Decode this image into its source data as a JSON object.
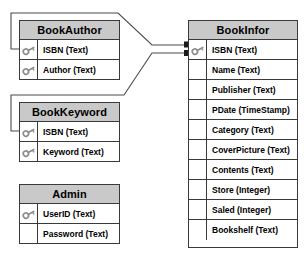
{
  "diagram": {
    "type": "er-diagram",
    "background_color": "#ffffff",
    "header_fill": "#c9c9c9",
    "border_color": "#3a3a3a",
    "key_icon_color": "#8c8c8c",
    "caption": ""
  },
  "entities": [
    {
      "id": "bookauthor",
      "name": "BookAuthor",
      "x": 19,
      "y": 20,
      "width": 101,
      "height": 60,
      "fields": [
        {
          "label": "ISBN (Text)",
          "key": true
        },
        {
          "label": "Author (Text)",
          "key": true
        }
      ]
    },
    {
      "id": "bookkeyword",
      "name": "BookKeyword",
      "x": 19,
      "y": 102,
      "width": 101,
      "height": 60,
      "fields": [
        {
          "label": "ISBN (Text)",
          "key": true
        },
        {
          "label": "Keyword (Text)",
          "key": true
        }
      ]
    },
    {
      "id": "admin",
      "name": "Admin",
      "x": 19,
      "y": 184,
      "width": 101,
      "height": 60,
      "fields": [
        {
          "label": "UserID (Text)",
          "key": true
        },
        {
          "label": "Password (Text)",
          "key": false
        }
      ]
    },
    {
      "id": "bookinfor",
      "name": "BookInfor",
      "x": 188,
      "y": 20,
      "width": 110,
      "height": 228,
      "fields": [
        {
          "label": "ISBN (Text)",
          "key": true
        },
        {
          "label": "Name (Text)",
          "key": false
        },
        {
          "label": "Publisher (Text)",
          "key": false
        },
        {
          "label": "PDate (TimeStamp)",
          "key": false
        },
        {
          "label": "Category (Text)",
          "key": false
        },
        {
          "label": "CoverPicture (Text)",
          "key": false
        },
        {
          "label": "Contents (Text)",
          "key": false
        },
        {
          "label": "Store (Integer)",
          "key": false
        },
        {
          "label": "Saled (Integer)",
          "key": false
        },
        {
          "label": "Bookshelf (Text)",
          "key": false
        }
      ]
    }
  ],
  "relationships": [
    {
      "id": "rel-bookauthor-bookinfor",
      "from_entity": "BookAuthor",
      "from_field": "ISBN (Text)",
      "to_entity": "BookInfor",
      "to_field": "ISBN (Text)",
      "path": "M 19 49 L 12 49 L 12 13 L 118 13 L 152 45 L 186 45",
      "arrow": "square"
    },
    {
      "id": "rel-bookkeyword-bookinfor",
      "from_entity": "BookKeyword",
      "from_field": "ISBN (Text)",
      "to_entity": "BookInfor",
      "to_field": "ISBN (Text)",
      "path": "M 19 131 L 12 131 L 12 95 L 124 95 L 152 53 L 186 53",
      "arrow": "square"
    }
  ]
}
